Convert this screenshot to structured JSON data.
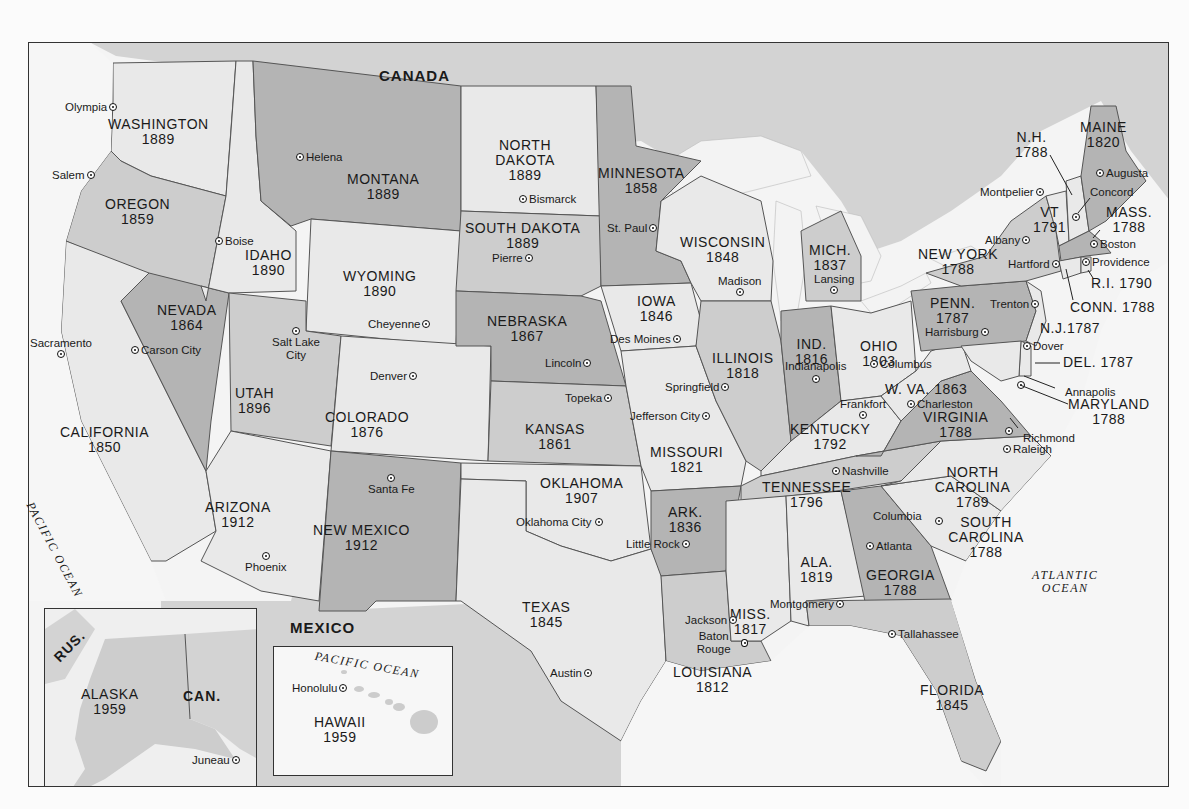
{
  "map": {
    "countries": {
      "canada": "CANADA",
      "mexico": "MEXICO",
      "russia_inset": "RUS.",
      "canada_inset": "CAN."
    },
    "oceans": {
      "pacific": "PACIFIC OCEAN",
      "pacific_hawaii": "PACIFIC OCEAN",
      "atlantic_1": "ATLANTIC",
      "atlantic_2": "OCEAN"
    },
    "colors": {
      "dark_state": "#b4b4b4",
      "mid_state": "#cdcdcd",
      "light_state": "#e9e9e9",
      "water": "#f6f6f6",
      "border": "#555555"
    },
    "states": [
      {
        "name": "WASHINGTON",
        "year": "1889",
        "capital": "Olympia"
      },
      {
        "name": "OREGON",
        "year": "1859",
        "capital": "Salem"
      },
      {
        "name": "CALIFORNIA",
        "year": "1850",
        "capital": "Sacramento"
      },
      {
        "name": "IDAHO",
        "year": "1890",
        "capital": "Boise"
      },
      {
        "name": "NEVADA",
        "year": "1864",
        "capital": "Carson City"
      },
      {
        "name": "MONTANA",
        "year": "1889",
        "capital": "Helena"
      },
      {
        "name": "WYOMING",
        "year": "1890",
        "capital": "Cheyenne"
      },
      {
        "name": "UTAH",
        "year": "1896",
        "capital": "Salt Lake City"
      },
      {
        "name": "ARIZONA",
        "year": "1912",
        "capital": "Phoenix"
      },
      {
        "name": "COLORADO",
        "year": "1876",
        "capital": "Denver"
      },
      {
        "name": "NEW MEXICO",
        "year": "1912",
        "capital": "Santa Fe"
      },
      {
        "name": "NORTH DAKOTA",
        "year": "1889",
        "capital": "Bismarck"
      },
      {
        "name": "SOUTH DAKOTA",
        "year": "1889",
        "capital": "Pierre"
      },
      {
        "name": "NEBRASKA",
        "year": "1867",
        "capital": "Lincoln"
      },
      {
        "name": "KANSAS",
        "year": "1861",
        "capital": "Topeka"
      },
      {
        "name": "OKLAHOMA",
        "year": "1907",
        "capital": "Oklahoma City"
      },
      {
        "name": "TEXAS",
        "year": "1845",
        "capital": "Austin"
      },
      {
        "name": "MINNESOTA",
        "year": "1858",
        "capital": "St. Paul"
      },
      {
        "name": "IOWA",
        "year": "1846",
        "capital": "Des Moines"
      },
      {
        "name": "MISSOURI",
        "year": "1821",
        "capital": "Jefferson City"
      },
      {
        "name": "ARK.",
        "year": "1836",
        "capital": "Little Rock"
      },
      {
        "name": "LOUISIANA",
        "year": "1812",
        "capital": "Baton Rouge"
      },
      {
        "name": "WISCONSIN",
        "year": "1848",
        "capital": "Madison"
      },
      {
        "name": "ILLINOIS",
        "year": "1818",
        "capital": "Springfield"
      },
      {
        "name": "MICH.",
        "year": "1837",
        "capital": "Lansing"
      },
      {
        "name": "IND.",
        "year": "1816",
        "capital": "Indianapolis"
      },
      {
        "name": "OHIO",
        "year": "1803",
        "capital": "Columbus"
      },
      {
        "name": "KENTUCKY",
        "year": "1792",
        "capital": "Frankfort"
      },
      {
        "name": "TENNESSEE",
        "year": "1796",
        "capital": "Nashville"
      },
      {
        "name": "MISS.",
        "year": "1817",
        "capital": "Jackson"
      },
      {
        "name": "ALA.",
        "year": "1819",
        "capital": "Montgomery"
      },
      {
        "name": "GEORGIA",
        "year": "1788",
        "capital": "Atlanta"
      },
      {
        "name": "FLORIDA",
        "year": "1845",
        "capital": "Tallahassee"
      },
      {
        "name": "SOUTH CAROLINA",
        "year": "1788",
        "capital": "Columbia"
      },
      {
        "name": "NORTH CAROLINA",
        "year": "1789",
        "capital": "Raleigh"
      },
      {
        "name": "VIRGINIA",
        "year": "1788",
        "capital": "Richmond"
      },
      {
        "name": "W. VA.",
        "year": "1863",
        "capital": "Charleston"
      },
      {
        "name": "MARYLAND",
        "year": "1788",
        "capital": "Annapolis"
      },
      {
        "name": "DEL.",
        "year": "1787",
        "capital": "Dover"
      },
      {
        "name": "N.J.",
        "year": "1787",
        "capital": "Trenton"
      },
      {
        "name": "PENN.",
        "year": "1787",
        "capital": "Harrisburg"
      },
      {
        "name": "NEW YORK",
        "year": "1788",
        "capital": "Albany"
      },
      {
        "name": "CONN.",
        "year": "1788",
        "capital": "Hartford"
      },
      {
        "name": "R.I.",
        "year": "1790",
        "capital": "Providence"
      },
      {
        "name": "MASS.",
        "year": "1788",
        "capital": "Boston"
      },
      {
        "name": "VT",
        "year": "1791",
        "capital": "Montpelier"
      },
      {
        "name": "N.H.",
        "year": "1788",
        "capital": "Concord"
      },
      {
        "name": "MAINE",
        "year": "1820",
        "capital": "Augusta"
      },
      {
        "name": "ALASKA",
        "year": "1959",
        "capital": "Juneau"
      },
      {
        "name": "HAWAII",
        "year": "1959",
        "capital": "Honolulu"
      }
    ]
  }
}
